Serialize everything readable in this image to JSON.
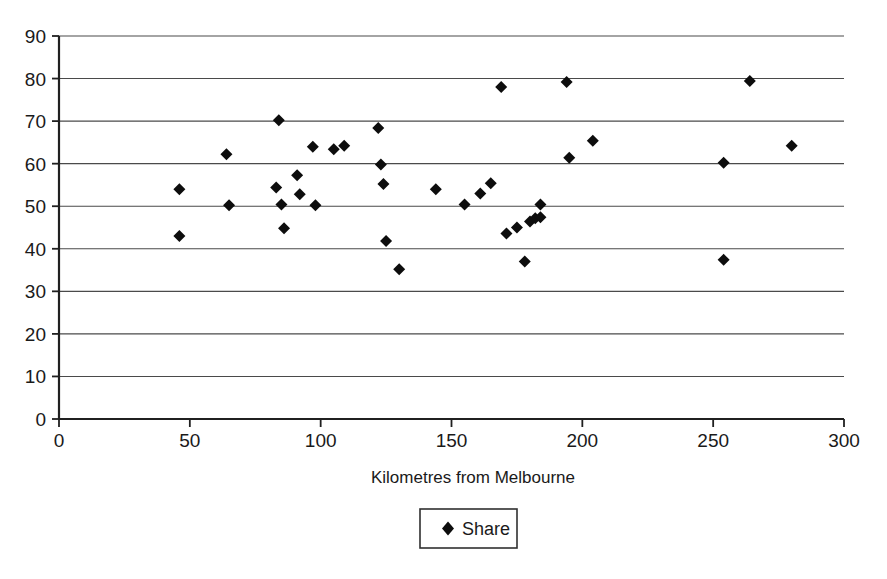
{
  "chart_data": {
    "type": "scatter",
    "title": "",
    "xlabel": "Kilometres from Melbourne",
    "ylabel": "",
    "xlim": [
      0,
      300
    ],
    "ylim": [
      0,
      90
    ],
    "xticks": [
      0,
      50,
      100,
      150,
      200,
      250,
      300
    ],
    "yticks": [
      0,
      10,
      20,
      30,
      40,
      50,
      60,
      70,
      80,
      90
    ],
    "grid": "horizontal",
    "legend_position": "bottom-center",
    "marker": "diamond",
    "marker_color": "#0d0d0d",
    "series": [
      {
        "name": "Share",
        "points": [
          [
            46,
            54.0
          ],
          [
            46,
            43.0
          ],
          [
            64,
            62.2
          ],
          [
            65,
            50.2
          ],
          [
            83,
            54.4
          ],
          [
            84,
            70.2
          ],
          [
            85,
            50.4
          ],
          [
            86,
            44.8
          ],
          [
            91,
            57.3
          ],
          [
            92,
            52.8
          ],
          [
            97,
            64.0
          ],
          [
            98,
            50.2
          ],
          [
            105,
            63.4
          ],
          [
            109,
            64.2
          ],
          [
            122,
            68.4
          ],
          [
            123,
            59.8
          ],
          [
            124,
            55.2
          ],
          [
            125,
            41.8
          ],
          [
            130,
            35.2
          ],
          [
            144,
            54.0
          ],
          [
            155,
            50.4
          ],
          [
            161,
            53.0
          ],
          [
            165,
            55.4
          ],
          [
            169,
            78.0
          ],
          [
            171,
            43.6
          ],
          [
            175,
            45.0
          ],
          [
            178,
            37.0
          ],
          [
            180,
            46.4
          ],
          [
            182,
            47.2
          ],
          [
            184,
            50.4
          ],
          [
            184,
            47.4
          ],
          [
            194,
            79.2
          ],
          [
            195,
            61.4
          ],
          [
            204,
            65.4
          ],
          [
            254,
            60.2
          ],
          [
            254,
            37.4
          ],
          [
            264,
            79.4
          ],
          [
            280,
            64.2
          ]
        ]
      }
    ]
  },
  "legend": {
    "entries": [
      {
        "label": "Share",
        "marker": "diamond"
      }
    ]
  },
  "axes": {
    "x_axis_title": "Kilometres from Melbourne",
    "x_tick_labels": [
      "0",
      "50",
      "100",
      "150",
      "200",
      "250",
      "300"
    ],
    "y_tick_labels": [
      "0",
      "10",
      "20",
      "30",
      "40",
      "50",
      "60",
      "70",
      "80",
      "90"
    ]
  }
}
